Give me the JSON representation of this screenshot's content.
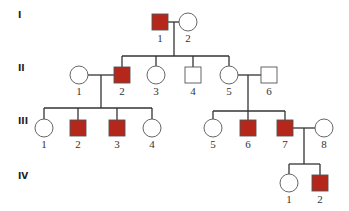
{
  "colors": {
    "affected": "#b5261b",
    "unaffected": "#ffffff",
    "stroke": "#555555",
    "line": "#333333"
  },
  "generations": [
    {
      "label": "I",
      "y": 22
    },
    {
      "label": "II",
      "y": 75
    },
    {
      "label": "III",
      "y": 128
    },
    {
      "label": "IV",
      "y": 183
    }
  ],
  "individuals": [
    {
      "id": "I-1",
      "gen": "I",
      "num": "1",
      "sex": "male",
      "affected": true,
      "cx": 160,
      "cy": 22
    },
    {
      "id": "I-2",
      "gen": "I",
      "num": "2",
      "sex": "female",
      "affected": false,
      "cx": 188,
      "cy": 22
    },
    {
      "id": "II-1",
      "gen": "II",
      "num": "1",
      "sex": "female",
      "affected": false,
      "cx": 79,
      "cy": 75
    },
    {
      "id": "II-2",
      "gen": "II",
      "num": "2",
      "sex": "male",
      "affected": true,
      "cx": 122,
      "cy": 75
    },
    {
      "id": "II-3",
      "gen": "II",
      "num": "3",
      "sex": "female",
      "affected": false,
      "cx": 156,
      "cy": 75
    },
    {
      "id": "II-4",
      "gen": "II",
      "num": "4",
      "sex": "male",
      "affected": false,
      "cx": 193,
      "cy": 75
    },
    {
      "id": "II-5",
      "gen": "II",
      "num": "5",
      "sex": "female",
      "affected": false,
      "cx": 229,
      "cy": 75
    },
    {
      "id": "II-6",
      "gen": "II",
      "num": "6",
      "sex": "male",
      "affected": false,
      "cx": 269,
      "cy": 75
    },
    {
      "id": "III-1",
      "gen": "III",
      "num": "1",
      "sex": "female",
      "affected": false,
      "cx": 44,
      "cy": 128
    },
    {
      "id": "III-2",
      "gen": "III",
      "num": "2",
      "sex": "male",
      "affected": true,
      "cx": 78,
      "cy": 128
    },
    {
      "id": "III-3",
      "gen": "III",
      "num": "3",
      "sex": "male",
      "affected": true,
      "cx": 117,
      "cy": 128
    },
    {
      "id": "III-4",
      "gen": "III",
      "num": "4",
      "sex": "female",
      "affected": false,
      "cx": 152,
      "cy": 128
    },
    {
      "id": "III-5",
      "gen": "III",
      "num": "5",
      "sex": "female",
      "affected": false,
      "cx": 213,
      "cy": 128
    },
    {
      "id": "III-6",
      "gen": "III",
      "num": "6",
      "sex": "male",
      "affected": true,
      "cx": 248,
      "cy": 128
    },
    {
      "id": "III-7",
      "gen": "III",
      "num": "7",
      "sex": "male",
      "affected": true,
      "cx": 285,
      "cy": 128
    },
    {
      "id": "III-8",
      "gen": "III",
      "num": "8",
      "sex": "female",
      "affected": false,
      "cx": 324,
      "cy": 128
    },
    {
      "id": "IV-1",
      "gen": "IV",
      "num": "1",
      "sex": "female",
      "affected": false,
      "cx": 289,
      "cy": 183
    },
    {
      "id": "IV-2",
      "gen": "IV",
      "num": "2",
      "sex": "male",
      "affected": true,
      "cx": 320,
      "cy": 183
    }
  ],
  "lines": [
    [
      168,
      22,
      179,
      22
    ],
    [
      174,
      22,
      174,
      56
    ],
    [
      122,
      56,
      229,
      56
    ],
    [
      122,
      56,
      122,
      67
    ],
    [
      156,
      56,
      156,
      66
    ],
    [
      193,
      56,
      193,
      67
    ],
    [
      229,
      56,
      229,
      66
    ],
    [
      88,
      75,
      114,
      75
    ],
    [
      101,
      75,
      101,
      108
    ],
    [
      44,
      108,
      152,
      108
    ],
    [
      44,
      108,
      44,
      119
    ],
    [
      78,
      108,
      78,
      120
    ],
    [
      117,
      108,
      117,
      120
    ],
    [
      152,
      108,
      152,
      119
    ],
    [
      238,
      75,
      261,
      75
    ],
    [
      248,
      75,
      248,
      111
    ],
    [
      213,
      111,
      285,
      111
    ],
    [
      213,
      111,
      213,
      119
    ],
    [
      248,
      111,
      248,
      120
    ],
    [
      285,
      111,
      285,
      120
    ],
    [
      293,
      128,
      315,
      128
    ],
    [
      304,
      128,
      304,
      164
    ],
    [
      289,
      164,
      320,
      164
    ],
    [
      289,
      164,
      289,
      174
    ],
    [
      320,
      164,
      320,
      175
    ]
  ]
}
